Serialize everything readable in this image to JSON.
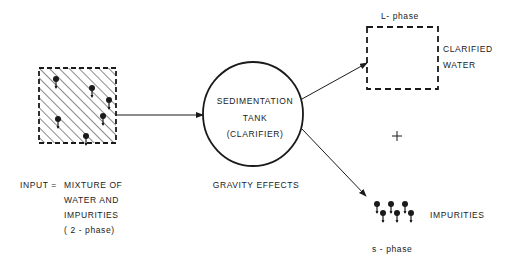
{
  "input": {
    "label_prefix": "INPUT =",
    "lines": [
      "MIXTURE    OF",
      "WATER    AND",
      "IMPURITIES",
      "( 2 - phase)"
    ]
  },
  "tank": {
    "lines": [
      "SEDIMENTATION",
      "TANK",
      "(CLARIFIER)"
    ],
    "caption": "GRAVITY  EFFECTS"
  },
  "output_liquid": {
    "phase_label": "L- phase",
    "lines": [
      "CLARIFIED",
      "WATER"
    ]
  },
  "plus": "+",
  "output_solid": {
    "label": "IMPURITIES",
    "phase_label": "s - phase"
  },
  "colors": {
    "ink": "#1a1a1a",
    "background": "#ffffff"
  }
}
